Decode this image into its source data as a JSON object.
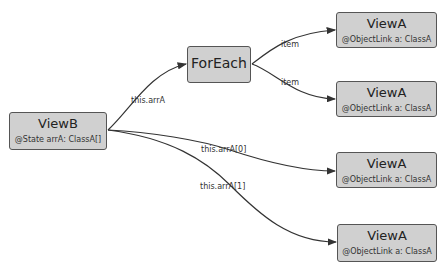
{
  "nodes": {
    "viewB": {
      "title": "ViewB",
      "sub": "@State arrA: ClassA[]"
    },
    "forEach": {
      "title": "ForEach"
    },
    "viewA1": {
      "title": "ViewA",
      "sub": "@ObjectLink a: ClassA"
    },
    "viewA2": {
      "title": "ViewA",
      "sub": "@ObjectLink a: ClassA"
    },
    "viewA3": {
      "title": "ViewA",
      "sub": "@ObjectLink a: ClassA"
    },
    "viewA4": {
      "title": "ViewA",
      "sub": "@ObjectLink a: ClassA"
    }
  },
  "edges": {
    "viewB_to_forEach": "this.arrA",
    "forEach_to_viewA1": "item",
    "forEach_to_viewA2": "item",
    "viewB_to_viewA3": "this.arrA[0]",
    "viewB_to_viewA4": "this.arrA[1]"
  },
  "colors": {
    "node_fill": "#d0d0d0",
    "node_border": "#555555",
    "edge": "#333333"
  }
}
